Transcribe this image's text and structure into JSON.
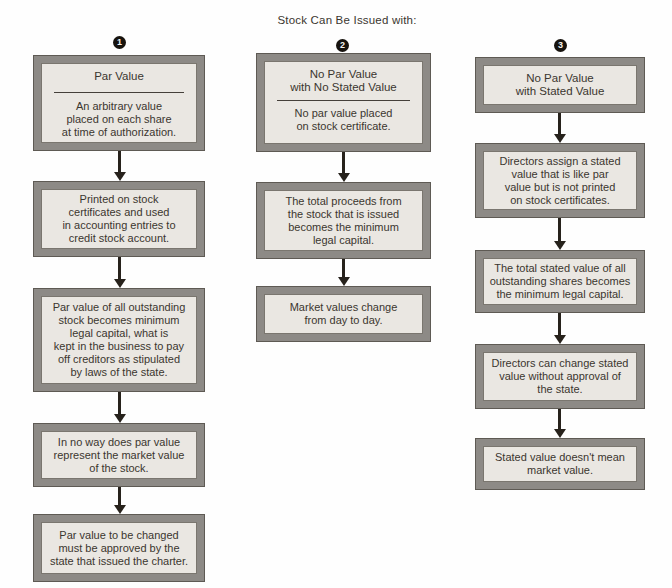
{
  "title": "Stock Can Be Issued with:",
  "colors": {
    "frame": "#8d8a86",
    "frame_edge": "#5e5a54",
    "box_fill": "#eae7e2",
    "text": "#3b362f",
    "arrow": "#27221c",
    "badge_bg": "#17130e",
    "badge_text": "#f6f4f0"
  },
  "columns": [
    {
      "number": "1",
      "boxes": [
        {
          "header": "Par Value",
          "divider": true,
          "body": "An arbitrary value\nplaced on each share\nat time of authorization."
        },
        {
          "body": "Printed on stock\ncertificates and used\nin accounting entries to\ncredit stock account."
        },
        {
          "body": "Par value of all outstanding\nstock becomes minimum\nlegal capital, what is\nkept in the business to pay\noff creditors as stipulated\nby laws of the state."
        },
        {
          "body": "In no way does par value\nrepresent the market value\nof the stock."
        },
        {
          "body": "Par value to be changed\nmust be approved by the\nstate that issued the charter."
        }
      ]
    },
    {
      "number": "2",
      "boxes": [
        {
          "header": "No Par Value\nwith No Stated Value",
          "divider": true,
          "body": "No par value placed\non stock certificate."
        },
        {
          "body": "The total proceeds from\nthe stock that is issued\nbecomes the minimum\nlegal capital."
        },
        {
          "body": "Market values change\nfrom day to day."
        }
      ]
    },
    {
      "number": "3",
      "boxes": [
        {
          "body": "No Par Value\nwith Stated Value"
        },
        {
          "body": "Directors assign a stated\nvalue that is like par\nvalue but is not printed\non stock certificates."
        },
        {
          "body": "The total stated value of all\noutstanding shares becomes\nthe minimum legal capital."
        },
        {
          "body": "Directors can change stated\nvalue without approval of\nthe state."
        },
        {
          "body": "Stated value doesn't mean\nmarket value."
        }
      ]
    }
  ]
}
